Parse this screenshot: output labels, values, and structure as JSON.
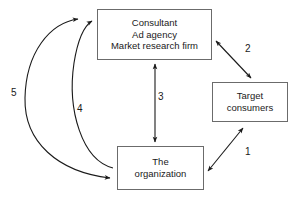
{
  "diagram": {
    "background_color": "#ffffff",
    "line_color": "#1a1a1a",
    "box_border_color": "#6b6b6b",
    "nodes": [
      {
        "id": "consultant",
        "lines": [
          "Consultant",
          "Ad agency",
          "Market research firm"
        ]
      },
      {
        "id": "target",
        "lines": [
          "Target",
          "consumers"
        ]
      },
      {
        "id": "organization",
        "lines": [
          "The",
          "organization"
        ]
      }
    ],
    "edges": [
      {
        "id": "edge-1",
        "label": "1",
        "from": "organization",
        "to": "target",
        "style": "straight",
        "arrowheads": "both"
      },
      {
        "id": "edge-2",
        "label": "2",
        "from": "consultant",
        "to": "target",
        "style": "straight",
        "arrowheads": "both"
      },
      {
        "id": "edge-3",
        "label": "3",
        "from": "consultant",
        "to": "organization",
        "style": "straight",
        "arrowheads": "both"
      },
      {
        "id": "edge-4",
        "label": "4",
        "from": "organization",
        "to": "consultant",
        "style": "curved",
        "arrowheads": "end"
      },
      {
        "id": "edge-5",
        "label": "5",
        "from": "consultant",
        "to": "organization",
        "style": "curved",
        "arrowheads": "both"
      }
    ]
  }
}
